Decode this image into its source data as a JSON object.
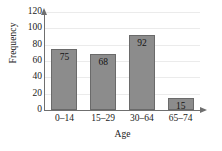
{
  "chart_data": {
    "type": "bar",
    "title": "",
    "xlabel": "Age",
    "ylabel": "Frequency",
    "categories": [
      "0–14",
      "15–29",
      "30–64",
      "65–74"
    ],
    "values": [
      75,
      68,
      92,
      15
    ],
    "value_labels": [
      "75",
      "68",
      "92",
      "15"
    ],
    "ylim": [
      0,
      120
    ],
    "ytick_labels": [
      "0",
      "20",
      "40",
      "60",
      "80",
      "100",
      "120"
    ],
    "ytick_values": [
      0,
      20,
      40,
      60,
      80,
      100,
      120
    ],
    "grid": true,
    "legend": null,
    "bar_color": "#8c8c8c",
    "bar_border_color": "#6a6a6a",
    "axis_color": "#6f6f6f",
    "grid_color": "#ebebeb",
    "background_color": "#ffffff",
    "y_axis_arrow": true,
    "x_axis_arrow": true
  }
}
